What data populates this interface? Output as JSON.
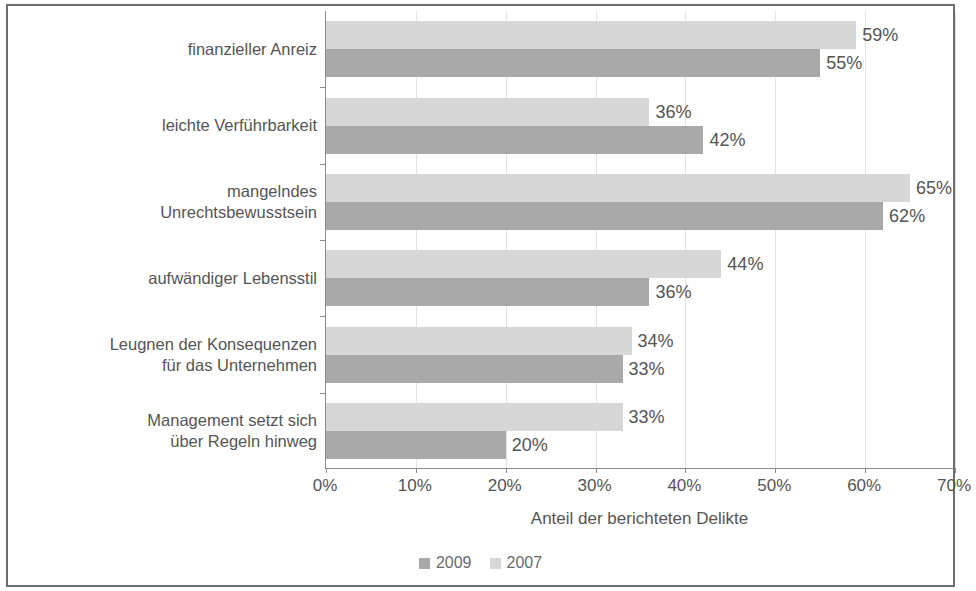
{
  "chart_data": {
    "type": "bar",
    "orientation": "horizontal",
    "title": "",
    "xlabel": "Anteil der berichteten Delikte",
    "ylabel": "",
    "xlim": [
      0,
      70
    ],
    "xtick_labels": [
      "0%",
      "10%",
      "20%",
      "30%",
      "40%",
      "50%",
      "60%",
      "70%"
    ],
    "xtick_values": [
      0,
      10,
      20,
      30,
      40,
      50,
      60,
      70
    ],
    "grid": true,
    "legend_position": "bottom",
    "categories": [
      "finanzieller Anreiz",
      "mangelndes\nUnrechtsbewusstsein",
      "leichte Verführbarkeit",
      "aufwändiger Lebensstil",
      "Leugnen der Konsequenzen\nfür das Unternehmen",
      "Management setzt sich\nüber Regeln hinweg"
    ],
    "categories_ordered": [
      "finanzieller Anreiz",
      "leichte Verführbarkeit",
      "mangelndes\nUnrechtsbewusstsein",
      "aufwändiger Lebensstil",
      "Leugnen der Konsequenzen\nfür das Unternehmen",
      "Management setzt sich\nüber Regeln hinweg"
    ],
    "series": [
      {
        "name": "2007",
        "color": "#d7d7d7",
        "values": [
          59,
          36,
          65,
          44,
          34,
          33
        ],
        "value_labels": [
          "59%",
          "36%",
          "65%",
          "44%",
          "34%",
          "33%"
        ]
      },
      {
        "name": "2009",
        "color": "#a9a9a9",
        "values": [
          55,
          42,
          62,
          36,
          33,
          20
        ],
        "value_labels": [
          "55%",
          "42%",
          "62%",
          "36%",
          "33%",
          "20%"
        ]
      }
    ],
    "legend": [
      {
        "label": "2009",
        "color": "#a9a9a9"
      },
      {
        "label": "2007",
        "color": "#d7d7d7"
      }
    ]
  }
}
